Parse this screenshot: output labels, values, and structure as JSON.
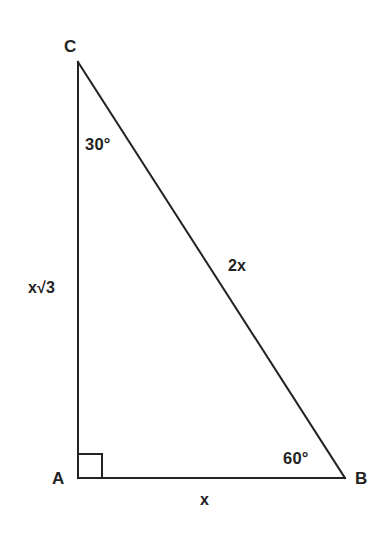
{
  "figure": {
    "kind": "right-triangle-diagram",
    "background_color": "#ffffff",
    "stroke_color": "#232323",
    "text_color": "#232323",
    "stroke_width": 2
  },
  "vertices": {
    "a": {
      "label": "A",
      "x": 78,
      "y": 478
    },
    "b": {
      "label": "B",
      "x": 345,
      "y": 478
    },
    "c": {
      "label": "C",
      "x": 78,
      "y": 62
    }
  },
  "angles": {
    "at_c": "30°",
    "at_b": "60°",
    "at_a": "right-angle-marker"
  },
  "sides": {
    "ac": "x√3",
    "ab": "x",
    "cb": "2x"
  },
  "right_angle_marker": {
    "size": 24,
    "corner_x": 78,
    "corner_y": 478
  }
}
